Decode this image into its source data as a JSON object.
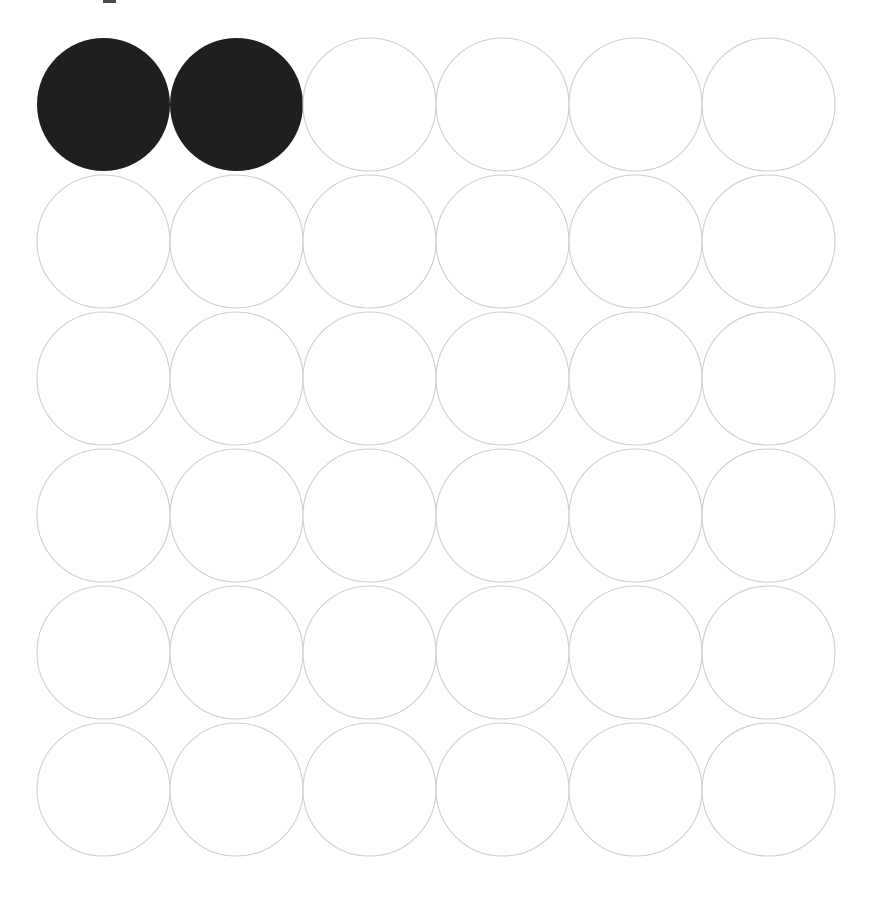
{
  "figure": {
    "title": "",
    "background_color": "#ffffff",
    "width": 879,
    "height": 911
  },
  "grid": {
    "rows": 6,
    "columns": 6,
    "total_circles": 36,
    "filled_count": 2,
    "unfilled_count": 34,
    "origin_x": 37,
    "origin_y": 38,
    "diameter": 133,
    "step_x": 133,
    "step_y": 137,
    "fill_color": "#1f1f1f",
    "outline_color": "#cfcfcf",
    "unfilled_fill_color": "#ffffff",
    "outline_width": 1.1
  },
  "cells": [
    {
      "row": 0,
      "col": 0,
      "state": "filled",
      "label": "circle-r1-c1"
    },
    {
      "row": 0,
      "col": 1,
      "state": "filled",
      "label": "circle-r1-c2"
    },
    {
      "row": 0,
      "col": 2,
      "state": "unfilled",
      "label": "circle-r1-c3"
    },
    {
      "row": 0,
      "col": 3,
      "state": "unfilled",
      "label": "circle-r1-c4"
    },
    {
      "row": 0,
      "col": 4,
      "state": "unfilled",
      "label": "circle-r1-c5"
    },
    {
      "row": 0,
      "col": 5,
      "state": "unfilled",
      "label": "circle-r1-c6"
    },
    {
      "row": 1,
      "col": 0,
      "state": "unfilled",
      "label": "circle-r2-c1"
    },
    {
      "row": 1,
      "col": 1,
      "state": "unfilled",
      "label": "circle-r2-c2"
    },
    {
      "row": 1,
      "col": 2,
      "state": "unfilled",
      "label": "circle-r2-c3"
    },
    {
      "row": 1,
      "col": 3,
      "state": "unfilled",
      "label": "circle-r2-c4"
    },
    {
      "row": 1,
      "col": 4,
      "state": "unfilled",
      "label": "circle-r2-c5"
    },
    {
      "row": 1,
      "col": 5,
      "state": "unfilled",
      "label": "circle-r2-c6"
    },
    {
      "row": 2,
      "col": 0,
      "state": "unfilled",
      "label": "circle-r3-c1"
    },
    {
      "row": 2,
      "col": 1,
      "state": "unfilled",
      "label": "circle-r3-c2"
    },
    {
      "row": 2,
      "col": 2,
      "state": "unfilled",
      "label": "circle-r3-c3"
    },
    {
      "row": 2,
      "col": 3,
      "state": "unfilled",
      "label": "circle-r3-c4"
    },
    {
      "row": 2,
      "col": 4,
      "state": "unfilled",
      "label": "circle-r3-c5"
    },
    {
      "row": 2,
      "col": 5,
      "state": "unfilled",
      "label": "circle-r3-c6"
    },
    {
      "row": 3,
      "col": 0,
      "state": "unfilled",
      "label": "circle-r4-c1"
    },
    {
      "row": 3,
      "col": 1,
      "state": "unfilled",
      "label": "circle-r4-c2"
    },
    {
      "row": 3,
      "col": 2,
      "state": "unfilled",
      "label": "circle-r4-c3"
    },
    {
      "row": 3,
      "col": 3,
      "state": "unfilled",
      "label": "circle-r4-c4"
    },
    {
      "row": 3,
      "col": 4,
      "state": "unfilled",
      "label": "circle-r4-c5"
    },
    {
      "row": 3,
      "col": 5,
      "state": "unfilled",
      "label": "circle-r4-c6"
    },
    {
      "row": 4,
      "col": 0,
      "state": "unfilled",
      "label": "circle-r5-c1"
    },
    {
      "row": 4,
      "col": 1,
      "state": "unfilled",
      "label": "circle-r5-c2"
    },
    {
      "row": 4,
      "col": 2,
      "state": "unfilled",
      "label": "circle-r5-c3"
    },
    {
      "row": 4,
      "col": 3,
      "state": "unfilled",
      "label": "circle-r5-c4"
    },
    {
      "row": 4,
      "col": 4,
      "state": "unfilled",
      "label": "circle-r5-c5"
    },
    {
      "row": 4,
      "col": 5,
      "state": "unfilled",
      "label": "circle-r5-c6"
    },
    {
      "row": 5,
      "col": 0,
      "state": "unfilled",
      "label": "circle-r6-c1"
    },
    {
      "row": 5,
      "col": 1,
      "state": "unfilled",
      "label": "circle-r6-c2"
    },
    {
      "row": 5,
      "col": 2,
      "state": "unfilled",
      "label": "circle-r6-c3"
    },
    {
      "row": 5,
      "col": 3,
      "state": "unfilled",
      "label": "circle-r6-c4"
    },
    {
      "row": 5,
      "col": 4,
      "state": "unfilled",
      "label": "circle-r6-c5"
    },
    {
      "row": 5,
      "col": 5,
      "state": "unfilled",
      "label": "circle-r6-c6"
    }
  ],
  "artifact": {
    "present": true,
    "x": 103,
    "y": 0,
    "width": 13,
    "height": 3,
    "color": "#2a2a2a"
  }
}
